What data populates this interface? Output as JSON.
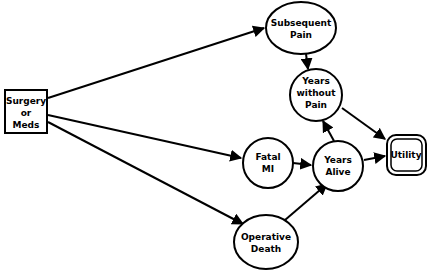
{
  "diagram": {
    "type": "influence-diagram",
    "nodes": [
      {
        "id": "surgery",
        "kind": "decision",
        "lines": [
          "Surgery",
          "or",
          "Meds"
        ]
      },
      {
        "id": "subsequent_pain",
        "kind": "chance",
        "lines": [
          "Subsequent",
          "Pain"
        ]
      },
      {
        "id": "years_without_pain",
        "kind": "chance",
        "lines": [
          "Years",
          "without",
          "Pain"
        ]
      },
      {
        "id": "fatal_mi",
        "kind": "chance",
        "lines": [
          "Fatal",
          "MI"
        ]
      },
      {
        "id": "years_alive",
        "kind": "chance",
        "lines": [
          "Years",
          "Alive"
        ]
      },
      {
        "id": "utility",
        "kind": "value",
        "lines": [
          "Utility"
        ]
      },
      {
        "id": "operative_death",
        "kind": "chance",
        "lines": [
          "Operative",
          "Death"
        ]
      }
    ],
    "edges": [
      {
        "from": "surgery",
        "to": "subsequent_pain"
      },
      {
        "from": "surgery",
        "to": "fatal_mi"
      },
      {
        "from": "surgery",
        "to": "operative_death"
      },
      {
        "from": "subsequent_pain",
        "to": "years_without_pain"
      },
      {
        "from": "years_without_pain",
        "to": "utility"
      },
      {
        "from": "fatal_mi",
        "to": "years_alive"
      },
      {
        "from": "years_alive",
        "to": "years_without_pain"
      },
      {
        "from": "years_alive",
        "to": "utility"
      },
      {
        "from": "operative_death",
        "to": "years_alive"
      }
    ]
  }
}
